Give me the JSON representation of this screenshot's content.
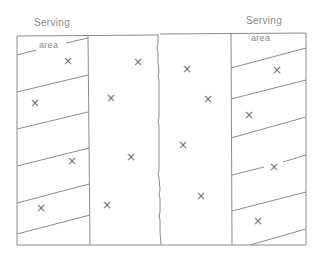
{
  "diagram": {
    "left_label_top": "Serving",
    "left_label_bottom": "area",
    "right_label_top": "Serving",
    "right_label_bottom": "area",
    "mark_glyph": "×",
    "marks": [
      {
        "id": "L1",
        "x": 68,
        "y": 61
      },
      {
        "id": "L2",
        "x": 35,
        "y": 103
      },
      {
        "id": "L3",
        "x": 72,
        "y": 161
      },
      {
        "id": "L4",
        "x": 41,
        "y": 208
      },
      {
        "id": "CL1",
        "x": 138,
        "y": 62
      },
      {
        "id": "CL2",
        "x": 111,
        "y": 98
      },
      {
        "id": "CL3",
        "x": 131,
        "y": 157
      },
      {
        "id": "CL4",
        "x": 107,
        "y": 205
      },
      {
        "id": "CR1",
        "x": 187,
        "y": 69
      },
      {
        "id": "CR2",
        "x": 208,
        "y": 99
      },
      {
        "id": "CR3",
        "x": 183,
        "y": 145
      },
      {
        "id": "CR4",
        "x": 201,
        "y": 196
      },
      {
        "id": "R1",
        "x": 277,
        "y": 70
      },
      {
        "id": "R2",
        "x": 249,
        "y": 115
      },
      {
        "id": "R3",
        "x": 274,
        "y": 167
      },
      {
        "id": "R4",
        "x": 258,
        "y": 221
      }
    ],
    "colors": {
      "line": "#8c8c8c",
      "text": "#8a8a8a",
      "mark": "#6f6f6f",
      "background": "#ffffff"
    }
  }
}
